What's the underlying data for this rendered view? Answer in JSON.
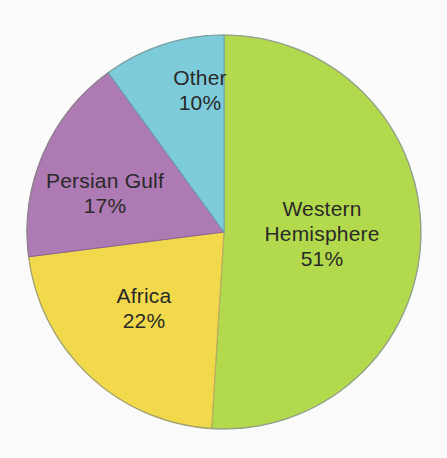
{
  "chart_data": {
    "type": "pie",
    "title": "",
    "subtitle": "",
    "xlabel": "",
    "ylabel": "",
    "legend_position": "none",
    "grid": false,
    "units": "percent",
    "start_angle_deg": 0,
    "direction": "clockwise",
    "categories": [
      "Western Hemisphere",
      "Africa",
      "Persian Gulf",
      "Other"
    ],
    "values": [
      51,
      22,
      17,
      10
    ],
    "slices": [
      {
        "label": "Western Hemisphere",
        "value": 51,
        "value_text": "51%",
        "color": "#b5dc4e",
        "start_deg": 0,
        "end_deg": 183.6
      },
      {
        "label": "Africa",
        "value": 22,
        "value_text": "22%",
        "color": "#f5dc4d",
        "start_deg": 183.6,
        "end_deg": 262.8
      },
      {
        "label": "Persian Gulf",
        "value": 17,
        "value_text": "17%",
        "color": "#b07cb6",
        "start_deg": 262.8,
        "end_deg": 324.0
      },
      {
        "label": "Other",
        "value": 10,
        "value_text": "10%",
        "color": "#7fcede",
        "start_deg": 324.0,
        "end_deg": 360.0
      }
    ]
  },
  "labels": {
    "western": {
      "name": "Western",
      "name2": "Hemisphere",
      "value": "51%"
    },
    "africa": {
      "name": "Africa",
      "value": "22%"
    },
    "persian": {
      "name": "Persian Gulf",
      "value": "17%"
    },
    "other": {
      "name": "Other",
      "value": "10%"
    }
  },
  "colors": {
    "western_hemisphere": "#b5dc4e",
    "africa": "#f5dc4d",
    "persian_gulf": "#b07cb6",
    "other": "#7fcede",
    "text": "#2a2a28",
    "background": "#fefefe",
    "outline": "#8e9a86"
  },
  "geometry": {
    "center_x": 224,
    "center_y": 232,
    "radius": 197
  }
}
